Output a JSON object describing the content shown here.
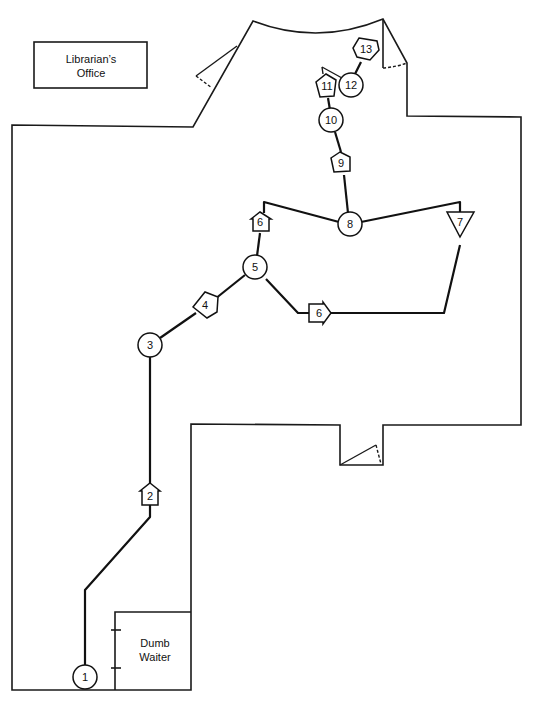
{
  "rooms": {
    "librarians_office": {
      "line1": "Librarian’s",
      "line2": "Office"
    },
    "dumb_waiter": {
      "line1": "Dumb",
      "line2": "Waiter"
    }
  },
  "nodes": [
    {
      "id": "1",
      "label": "1",
      "shape": "circle"
    },
    {
      "id": "2",
      "label": "2",
      "shape": "pentagon-up"
    },
    {
      "id": "3",
      "label": "3",
      "shape": "circle"
    },
    {
      "id": "4",
      "label": "4",
      "shape": "pentagon-diagonal"
    },
    {
      "id": "5",
      "label": "5",
      "shape": "circle"
    },
    {
      "id": "6a",
      "label": "6",
      "shape": "pentagon-up"
    },
    {
      "id": "6b",
      "label": "6",
      "shape": "pentagon-right"
    },
    {
      "id": "7",
      "label": "7",
      "shape": "triangle-down"
    },
    {
      "id": "8",
      "label": "8",
      "shape": "circle"
    },
    {
      "id": "9",
      "label": "9",
      "shape": "pentagon-up"
    },
    {
      "id": "10",
      "label": "10",
      "shape": "circle"
    },
    {
      "id": "11",
      "label": "11",
      "shape": "pentagon-up"
    },
    {
      "id": "12",
      "label": "12",
      "shape": "circle"
    },
    {
      "id": "13",
      "label": "13",
      "shape": "pentagon-up"
    }
  ],
  "colors": {
    "line": "#111111",
    "background": "#ffffff"
  }
}
